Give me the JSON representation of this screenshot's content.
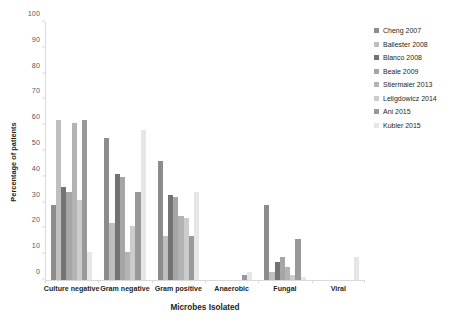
{
  "chart_data": {
    "type": "bar",
    "title": "",
    "xlabel": "Microbes Isolated",
    "ylabel": "Percentage of patients",
    "ylim": [
      0,
      100
    ],
    "ytick_step": 10,
    "yticks": [
      0,
      10,
      20,
      30,
      40,
      50,
      60,
      70,
      80,
      90,
      100
    ],
    "grid": false,
    "legend_position": "right",
    "categories": [
      "Culture negative",
      "Gram negative",
      "Gram positive",
      "Anaerobic",
      "Fungal",
      "Viral"
    ],
    "series": [
      {
        "name": "Cheng 2007",
        "color": "#8c8c8c",
        "values": [
          29,
          55,
          46,
          0,
          29,
          0
        ]
      },
      {
        "name": "Ballester 2008",
        "color": "#bfbfbf",
        "values": [
          62,
          22,
          17,
          0,
          3,
          0
        ]
      },
      {
        "name": "Blanco 2008",
        "color": "#737373",
        "values": [
          36,
          41,
          33,
          0,
          7,
          0
        ]
      },
      {
        "name": "Beale 2009",
        "color": "#a6a6a6",
        "values": [
          34,
          40,
          32,
          0,
          9,
          0
        ]
      },
      {
        "name": "Stiermaier 2013",
        "color": "#b3b3b3",
        "values": [
          61,
          11,
          25,
          0,
          5,
          0
        ]
      },
      {
        "name": "Leligdowicz 2014",
        "color": "#cccccc",
        "values": [
          31,
          21,
          24,
          0,
          2,
          0
        ]
      },
      {
        "name": "Ani 2015",
        "color": "#999999",
        "values": [
          62,
          34,
          17,
          2,
          16,
          0
        ]
      },
      {
        "name": "Kubler 2015",
        "color": "#e6e6e6",
        "values": [
          11,
          58,
          34,
          3,
          1,
          9
        ]
      }
    ]
  },
  "axes": {
    "y_title": "Percentage of patients",
    "x_title": "Microbes Isolated"
  }
}
